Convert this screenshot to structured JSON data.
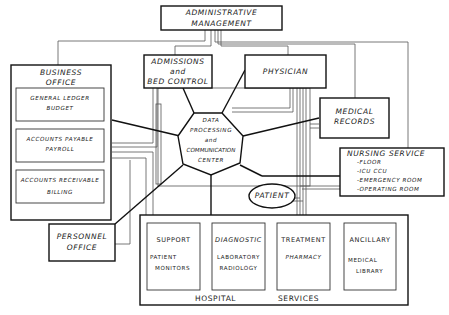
{
  "hub": {
    "line1": "DATA",
    "line2": "PROCESSING",
    "line3": "and",
    "line4": "COMMUNICATION",
    "line5": "CENTER"
  },
  "admin": {
    "line1": "ADMINISTRATIVE",
    "line2": "MANAGEMENT"
  },
  "admissions": {
    "line1": "ADMISSIONS",
    "line2": "and",
    "line3": "BED CONTROL"
  },
  "physician": {
    "label": "PHYSICIAN"
  },
  "medical_records": {
    "line1": "MEDICAL",
    "line2": "RECORDS"
  },
  "nursing": {
    "title": "NURSING  SERVICE",
    "items": [
      "-FLOOR",
      "-ICU CCU",
      "-EMERGENCY  ROOM",
      "-OPERATING  ROOM"
    ]
  },
  "business": {
    "line1": "BUSINESS",
    "line2": "OFFICE",
    "sub": [
      {
        "line1": "GENERAL  LEDGER",
        "line2": "BUDGET"
      },
      {
        "line1": "ACCOUNTS  PAYABLE",
        "line2": "PAYROLL"
      },
      {
        "line1": "ACCOUNTS RECEIVABLE",
        "line2": "BILLING"
      }
    ]
  },
  "personnel": {
    "line1": "PERSONNEL",
    "line2": "OFFICE"
  },
  "patient": {
    "label": "PATIENT"
  },
  "hospital_services": {
    "label_left": "HOSPITAL",
    "label_right": "SERVICES",
    "units": [
      {
        "title": "SUPPORT",
        "line1": "PATIENT",
        "line2": "MONITORS"
      },
      {
        "title": "DIAGNOSTIC",
        "line1": "LABORATORY",
        "line2": "RADIOLOGY"
      },
      {
        "title": "TREATMENT",
        "line1": "PHARMACY",
        "line2": ""
      },
      {
        "title": "ANCILLARY",
        "line1": "MEDICAL",
        "line2": "LIBRARY"
      }
    ]
  }
}
